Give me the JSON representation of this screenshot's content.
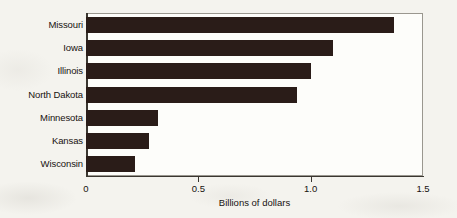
{
  "chart_data": {
    "type": "bar",
    "orientation": "horizontal",
    "title": "",
    "xlabel": "Billions of dollars",
    "ylabel": "",
    "categories": [
      "Missouri",
      "Iowa",
      "Illinois",
      "North Dakota",
      "Minnesota",
      "Kansas",
      "Wisconsin"
    ],
    "values": [
      1.37,
      1.1,
      1.0,
      0.94,
      0.32,
      0.28,
      0.22
    ],
    "xlim": [
      0,
      1.5
    ],
    "xticks": [
      0,
      0.5,
      1.0,
      1.5
    ],
    "xtick_labels": [
      "0",
      "0.5",
      "1.0",
      "1.5"
    ],
    "grid": false,
    "legend": null,
    "bar_color": "#2a1c18",
    "plot_background": "#fdfdfa",
    "figure_background": "#f4f3ee",
    "axis_color": "#3a3630",
    "frame_color": "#9a978f"
  }
}
